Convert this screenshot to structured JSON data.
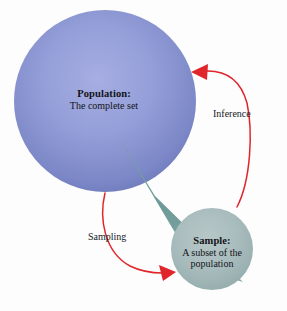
{
  "diagram": {
    "background_color": "#fdfdfd",
    "population": {
      "title": "Population:",
      "description": "The complete set",
      "shape": "circle",
      "color": "#8b96d4",
      "color_light": "#a3abdf",
      "color_dark": "#6a77b6",
      "center_x": 105,
      "center_y": 101,
      "radius": 91
    },
    "sample": {
      "title": "Sample:",
      "description_line1": "A subset of the",
      "description_line2": "population",
      "shape": "circle",
      "color": "#a8bcbd",
      "color_light": "#b4c5c6",
      "color_dark": "#96adae",
      "center_x": 212,
      "center_y": 249,
      "radius": 41
    },
    "cone": {
      "name": "sampling-cone",
      "color": "#6b9a9a",
      "apex_x": 113,
      "apex_y": 128
    },
    "arrows": {
      "sampling": {
        "label": "Sampling",
        "color": "#e0252b",
        "from": "population",
        "to": "sample"
      },
      "inference": {
        "label": "Inference",
        "color": "#e0252b",
        "from": "sample",
        "to": "population"
      }
    }
  }
}
